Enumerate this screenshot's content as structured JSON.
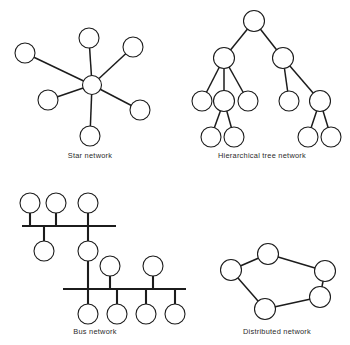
{
  "figure": {
    "background_color": "#ffffff",
    "ink_color": "#1c1c1c",
    "node_fill": "#ffffff"
  },
  "panels": [
    {
      "id": "star",
      "caption": "Star network",
      "caption_x": 90,
      "caption_y": 158,
      "node_radius": 10,
      "hub": {
        "cx": 92,
        "cy": 85,
        "r": 9.5
      },
      "nodes": [
        {
          "name": "star-node-top",
          "cx": 89,
          "cy": 38,
          "r": 10
        },
        {
          "name": "star-node-upper-left",
          "cx": 25,
          "cy": 53,
          "r": 10
        },
        {
          "name": "star-node-upper-right",
          "cx": 133,
          "cy": 47,
          "r": 10
        },
        {
          "name": "star-node-left",
          "cx": 48,
          "cy": 100,
          "r": 10
        },
        {
          "name": "star-node-right",
          "cx": 140,
          "cy": 110,
          "r": 10
        },
        {
          "name": "star-node-bottom",
          "cx": 90,
          "cy": 136,
          "r": 10
        }
      ],
      "links": [
        {
          "x1": 92,
          "y1": 85,
          "x2": 89,
          "y2": 38
        },
        {
          "x1": 92,
          "y1": 85,
          "x2": 25,
          "y2": 53
        },
        {
          "x1": 92,
          "y1": 85,
          "x2": 133,
          "y2": 47
        },
        {
          "x1": 92,
          "y1": 85,
          "x2": 48,
          "y2": 100
        },
        {
          "x1": 92,
          "y1": 85,
          "x2": 140,
          "y2": 110
        },
        {
          "x1": 92,
          "y1": 85,
          "x2": 90,
          "y2": 136
        }
      ]
    },
    {
      "id": "hierarchical-tree",
      "caption": "Hierarchical tree network",
      "caption_x": 262,
      "caption_y": 158,
      "node_radius": 10,
      "nodes": [
        {
          "name": "tree-root",
          "cx": 254,
          "cy": 21,
          "r": 10.5
        },
        {
          "name": "tree-level2-left",
          "cx": 224,
          "cy": 58,
          "r": 10.5
        },
        {
          "name": "tree-level2-right",
          "cx": 283,
          "cy": 58,
          "r": 10.5
        },
        {
          "name": "tree-level3-a",
          "cx": 202,
          "cy": 101,
          "r": 10
        },
        {
          "name": "tree-level3-b",
          "cx": 224,
          "cy": 101,
          "r": 10.5
        },
        {
          "name": "tree-level3-c",
          "cx": 248,
          "cy": 101,
          "r": 10
        },
        {
          "name": "tree-level3-d",
          "cx": 289,
          "cy": 101,
          "r": 10
        },
        {
          "name": "tree-level3-e",
          "cx": 320,
          "cy": 101,
          "r": 10.5
        },
        {
          "name": "tree-leaf-a",
          "cx": 211,
          "cy": 137,
          "r": 10
        },
        {
          "name": "tree-leaf-b",
          "cx": 234,
          "cy": 137,
          "r": 10
        },
        {
          "name": "tree-leaf-c",
          "cx": 308,
          "cy": 137,
          "r": 10
        },
        {
          "name": "tree-leaf-d",
          "cx": 331,
          "cy": 137,
          "r": 10
        }
      ],
      "links": [
        {
          "x1": 254,
          "y1": 21,
          "x2": 224,
          "y2": 58
        },
        {
          "x1": 254,
          "y1": 21,
          "x2": 283,
          "y2": 58
        },
        {
          "x1": 224,
          "y1": 58,
          "x2": 202,
          "y2": 101
        },
        {
          "x1": 224,
          "y1": 58,
          "x2": 224,
          "y2": 101
        },
        {
          "x1": 224,
          "y1": 58,
          "x2": 248,
          "y2": 101
        },
        {
          "x1": 283,
          "y1": 58,
          "x2": 289,
          "y2": 101
        },
        {
          "x1": 283,
          "y1": 58,
          "x2": 320,
          "y2": 101
        },
        {
          "x1": 224,
          "y1": 101,
          "x2": 211,
          "y2": 137
        },
        {
          "x1": 224,
          "y1": 101,
          "x2": 234,
          "y2": 137
        },
        {
          "x1": 320,
          "y1": 101,
          "x2": 308,
          "y2": 137
        },
        {
          "x1": 320,
          "y1": 101,
          "x2": 331,
          "y2": 137
        }
      ]
    },
    {
      "id": "bus",
      "caption": "Bus network",
      "caption_x": 95,
      "caption_y": 334,
      "node_radius": 10,
      "bars": [
        {
          "name": "bus-bar-upper",
          "x1": 22,
          "y1": 226,
          "x2": 116,
          "y2": 226
        },
        {
          "name": "bus-bar-lower",
          "x1": 63,
          "y1": 289,
          "x2": 186,
          "y2": 289
        }
      ],
      "nodes": [
        {
          "name": "bus-node-upper-1",
          "cx": 30,
          "cy": 203,
          "r": 10
        },
        {
          "name": "bus-node-upper-2",
          "cx": 56,
          "cy": 203,
          "r": 10
        },
        {
          "name": "bus-node-upper-3",
          "cx": 88,
          "cy": 203,
          "r": 10
        },
        {
          "name": "bus-node-upper-drop-1",
          "cx": 44,
          "cy": 251,
          "r": 10
        },
        {
          "name": "bus-node-bridge",
          "cx": 88,
          "cy": 251,
          "r": 10
        },
        {
          "name": "bus-node-lower-above-1",
          "cx": 110,
          "cy": 266,
          "r": 10
        },
        {
          "name": "bus-node-lower-above-2",
          "cx": 153,
          "cy": 266,
          "r": 10
        },
        {
          "name": "bus-node-lower-drop-1",
          "cx": 88,
          "cy": 314,
          "r": 10
        },
        {
          "name": "bus-node-lower-drop-2",
          "cx": 117,
          "cy": 314,
          "r": 10
        },
        {
          "name": "bus-node-lower-drop-3",
          "cx": 146,
          "cy": 314,
          "r": 10
        },
        {
          "name": "bus-node-lower-drop-4",
          "cx": 175,
          "cy": 314,
          "r": 10
        }
      ],
      "stubs": [
        {
          "x1": 30,
          "y1": 213,
          "x2": 30,
          "y2": 226
        },
        {
          "x1": 56,
          "y1": 213,
          "x2": 56,
          "y2": 226
        },
        {
          "x1": 88,
          "y1": 213,
          "x2": 88,
          "y2": 226
        },
        {
          "x1": 44,
          "y1": 226,
          "x2": 44,
          "y2": 241
        },
        {
          "x1": 88,
          "y1": 226,
          "x2": 88,
          "y2": 241
        },
        {
          "x1": 88,
          "y1": 261,
          "x2": 88,
          "y2": 289
        },
        {
          "x1": 110,
          "y1": 276,
          "x2": 110,
          "y2": 289
        },
        {
          "x1": 153,
          "y1": 276,
          "x2": 153,
          "y2": 289
        },
        {
          "x1": 88,
          "y1": 289,
          "x2": 88,
          "y2": 304
        },
        {
          "x1": 117,
          "y1": 289,
          "x2": 117,
          "y2": 304
        },
        {
          "x1": 146,
          "y1": 289,
          "x2": 146,
          "y2": 304
        },
        {
          "x1": 175,
          "y1": 289,
          "x2": 175,
          "y2": 304
        }
      ]
    },
    {
      "id": "distributed",
      "caption": "Distributed network",
      "caption_x": 277,
      "caption_y": 334,
      "node_radius": 10,
      "nodes": [
        {
          "name": "distributed-node-top",
          "cx": 268,
          "cy": 254,
          "r": 10.5
        },
        {
          "name": "distributed-node-left",
          "cx": 231,
          "cy": 270,
          "r": 10.5
        },
        {
          "name": "distributed-node-right",
          "cx": 325,
          "cy": 271,
          "r": 10.5
        },
        {
          "name": "distributed-node-lower-right",
          "cx": 320,
          "cy": 297,
          "r": 10.5
        },
        {
          "name": "distributed-node-bottom",
          "cx": 265,
          "cy": 309,
          "r": 10.5
        }
      ],
      "links": [
        {
          "x1": 268,
          "y1": 254,
          "x2": 231,
          "y2": 270
        },
        {
          "x1": 268,
          "y1": 254,
          "x2": 325,
          "y2": 271
        },
        {
          "x1": 325,
          "y1": 271,
          "x2": 320,
          "y2": 297
        },
        {
          "x1": 320,
          "y1": 297,
          "x2": 265,
          "y2": 309
        },
        {
          "x1": 265,
          "y1": 309,
          "x2": 231,
          "y2": 270
        }
      ]
    }
  ]
}
